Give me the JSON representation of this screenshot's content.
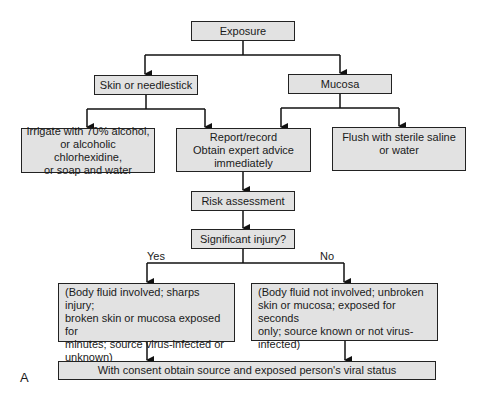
{
  "figure_label": "A",
  "nodes": {
    "exposure": "Exposure",
    "skin": "Skin or needlestick",
    "mucosa": "Mucosa",
    "irrigate": "Irrigate with 70% alcohol,\nor alcoholic chlorhexidine,\nor soap and water",
    "report": "Report/record\nObtain expert advice\nimmediately",
    "flush": "Flush with sterile saline\nor water",
    "risk": "Risk assessment",
    "significant": "Significant injury?",
    "yes_case": "(Body fluid involved; sharps injury;\nbroken skin or mucosa exposed for\nminutes; source virus-infected or\nunknown)",
    "no_case": "(Body fluid not involved; unbroken\nskin or mucosa; exposed for seconds\nonly; source known or not virus-\ninfected)",
    "consent": "With consent obtain source and exposed person's viral status"
  },
  "edge_labels": {
    "yes": "Yes",
    "no": "No"
  },
  "colors": {
    "box_fill": "#e2e2e2",
    "box_border": "#222222",
    "line": "#111111"
  }
}
